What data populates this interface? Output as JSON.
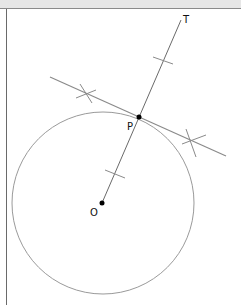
{
  "diagram": {
    "labels": {
      "top_point": "T",
      "tangent_point": "P",
      "center": "O"
    },
    "colors": {
      "construction_line": "#8a8a8a",
      "circle": "#9a9a9a",
      "point": "#000000",
      "header": "#e6e6e6",
      "border": "#6a6a6a"
    },
    "circle": {
      "cx": 103,
      "cy": 203,
      "r": 91
    },
    "points": {
      "O": {
        "x": 102,
        "y": 203
      },
      "P": {
        "x": 139,
        "y": 117
      },
      "T": {
        "x": 181,
        "y": 20
      }
    },
    "tangent_line": {
      "x1": 50,
      "y1": 77,
      "x2": 226,
      "y2": 156
    }
  }
}
